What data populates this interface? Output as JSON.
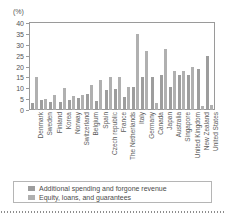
{
  "chart_data": {
    "type": "bar",
    "title": "",
    "subtitle": "",
    "unit_label": "(%)",
    "xlabel": "",
    "ylabel": "",
    "ylim": [
      0,
      40
    ],
    "yticks": [
      0,
      5,
      10,
      15,
      20,
      25,
      30,
      35,
      40
    ],
    "grid": false,
    "legend_position": "bottom",
    "categories": [
      "Denmark",
      "Sweden",
      "Finland",
      "Korea",
      "Norway",
      "Switzerland",
      "Belgium",
      "Spain",
      "Czech republic",
      "France",
      "The Netherlands",
      "Italy",
      "Germany",
      "Canada",
      "Japan",
      "Australia",
      "Singapore",
      "United Kingdom",
      "New Zealand",
      "United States"
    ],
    "series": [
      {
        "name": "Additional spending and forgone revenue",
        "color": "#9d9d9d",
        "values": [
          3.0,
          4.5,
          3.5,
          3.5,
          4.5,
          5.5,
          7.5,
          4.0,
          9.0,
          9.5,
          6.0,
          10.5,
          15.0,
          15.0,
          16.0,
          10.5,
          16.0,
          16.0,
          19.0,
          25.0
        ]
      },
      {
        "name": "Equity, loans, and guarantees",
        "color": "#b0b0b0",
        "values": [
          15.0,
          5.0,
          7.0,
          10.0,
          6.5,
          7.0,
          11.5,
          14.0,
          15.0,
          15.0,
          10.5,
          35.0,
          27.0,
          3.0,
          28.0,
          18.0,
          18.0,
          20.0,
          2.0,
          2.5
        ]
      }
    ],
    "legend": [
      "Additional spending and forgone revenue",
      "Equity, loans, and guarantees"
    ]
  }
}
